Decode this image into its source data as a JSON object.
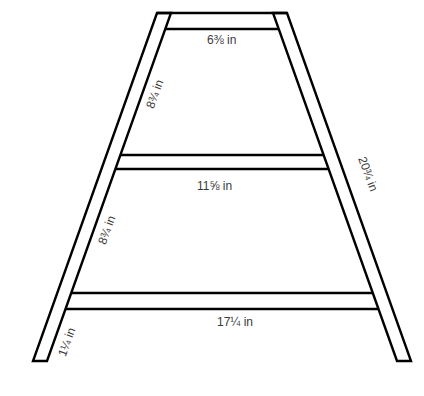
{
  "diagram": {
    "title": "",
    "stroke_color": "#000000",
    "label_color": "#3a3a3a",
    "labels": {
      "top_rung": "6⅜ in",
      "upper_left_spacing": "8¾ in",
      "right_leg_length": "20¾ in",
      "middle_rung": "11⅝ in",
      "lower_left_spacing": "8¾ in",
      "bottom_rung": "17¼ in",
      "leg_width": "1¼ in"
    }
  }
}
